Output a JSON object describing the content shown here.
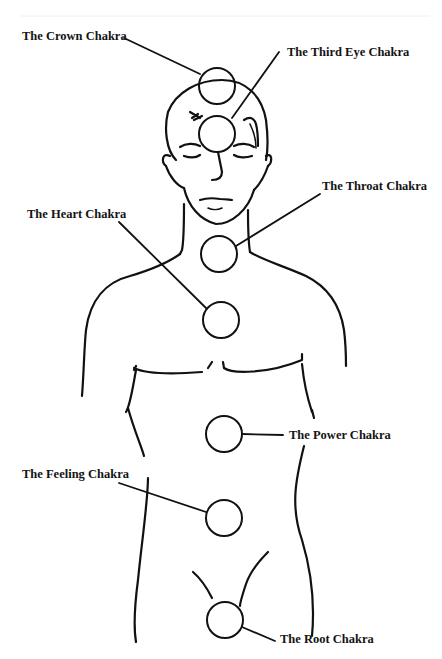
{
  "diagram": {
    "title": "",
    "colors": {
      "ink": "#111111",
      "background": "#ffffff"
    },
    "chakras": [
      {
        "id": "crown",
        "label": "The Crown Chakra",
        "cx": 217,
        "cy": 86
      },
      {
        "id": "third-eye",
        "label": "The Third Eye Chakra",
        "cx": 217,
        "cy": 134
      },
      {
        "id": "throat",
        "label": "The Throat Chakra",
        "cx": 219,
        "cy": 254
      },
      {
        "id": "heart",
        "label": "The Heart Chakra",
        "cx": 221,
        "cy": 320
      },
      {
        "id": "power",
        "label": "The Power Chakra",
        "cx": 224,
        "cy": 434
      },
      {
        "id": "feeling",
        "label": "The Feeling Chakra",
        "cx": 224,
        "cy": 518
      },
      {
        "id": "root",
        "label": "The Root Chakra",
        "cx": 225,
        "cy": 620
      }
    ]
  }
}
